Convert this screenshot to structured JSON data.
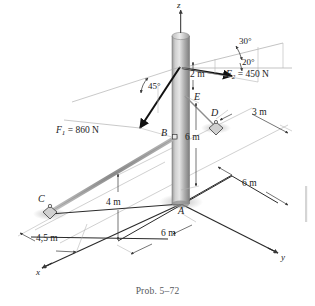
{
  "figure": {
    "caption": "Prob. 5–72",
    "background_color": "#ffffff",
    "ink_color": "#1b1b1b",
    "pole_color_light": "#d8d8d8",
    "pole_color_dark": "#8a8a8a",
    "cable_color": "#9a9a9a",
    "shadow_color": "#c9c9c9"
  },
  "axes": [
    {
      "name": "z-axis",
      "label": "z"
    },
    {
      "name": "y-axis",
      "label": "y"
    },
    {
      "name": "x-axis",
      "label": "x"
    }
  ],
  "points": [
    {
      "name": "point-a",
      "label": "A"
    },
    {
      "name": "point-b",
      "label": "B"
    },
    {
      "name": "point-c",
      "label": "C"
    },
    {
      "name": "point-d",
      "label": "D"
    },
    {
      "name": "point-e",
      "label": "E"
    }
  ],
  "forces": [
    {
      "name": "force-f1",
      "symbol": "F",
      "subscript": "1",
      "equals": " = ",
      "magnitude": "860",
      "unit": "N",
      "full_label": "F1 = 860 N",
      "angle_label": "45°"
    },
    {
      "name": "force-f2",
      "symbol": "F",
      "subscript": "2",
      "equals": " = ",
      "magnitude": "450",
      "unit": "N",
      "full_label": "F2 = 450 N",
      "angle_labels": [
        "30°",
        "20°"
      ]
    }
  ],
  "angles": [
    {
      "name": "angle-30",
      "label": "30°"
    },
    {
      "name": "angle-20",
      "label": "20°"
    },
    {
      "name": "angle-45",
      "label": "45°"
    }
  ],
  "dimensions": [
    {
      "name": "dim-2m-top",
      "label": "2 m"
    },
    {
      "name": "dim-3m-right",
      "label": "3 m"
    },
    {
      "name": "dim-6m-vertical",
      "label": "6 m"
    },
    {
      "name": "dim-6m-right",
      "label": "6 m"
    },
    {
      "name": "dim-6m-bottom",
      "label": "6 m"
    },
    {
      "name": "dim-4m-left",
      "label": "4 m"
    },
    {
      "name": "dim-4p5m-left",
      "label": "4,5 m"
    }
  ]
}
